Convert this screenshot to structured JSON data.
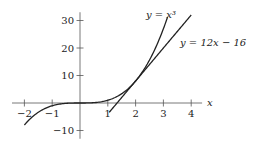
{
  "chart_data": {
    "type": "line",
    "title": "",
    "xlabel": "x",
    "ylabel": "",
    "xlim": [
      -2.2,
      4.5
    ],
    "ylim": [
      -13,
      33
    ],
    "grid": false,
    "x_ticks": [
      -2,
      -1,
      1,
      2,
      3,
      4
    ],
    "x_tick_labels": [
      "−2",
      "−1",
      "1",
      "2",
      "3",
      "4"
    ],
    "y_ticks": [
      30,
      20,
      10,
      -10
    ],
    "y_tick_labels": [
      "30",
      "20",
      "10",
      "−10"
    ],
    "series": [
      {
        "name": "y = x^3",
        "label": "y = x³",
        "function": "x^3",
        "x_range": [
          -2,
          3.15
        ],
        "label_position": "top"
      },
      {
        "name": "y = 12x - 16",
        "label": "y = 12x − 16",
        "function": "12x - 16",
        "x_range": [
          1.05,
          4.0
        ],
        "label_position": "right"
      }
    ]
  }
}
